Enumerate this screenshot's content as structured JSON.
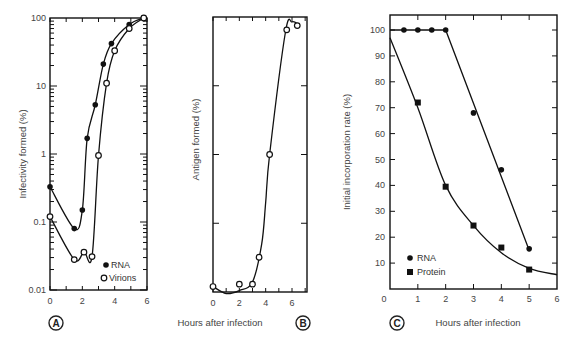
{
  "figure": {
    "shared_xlabel": "Hours after infection"
  },
  "chart_data": [
    {
      "panel": "A",
      "type": "line",
      "title": "",
      "xlabel": "Hours after infection",
      "ylabel": "Infectivity formed (%)",
      "yscale": "log",
      "xlim": [
        0,
        6
      ],
      "ylim": [
        0.01,
        100
      ],
      "xticks": [
        0,
        2,
        4,
        6
      ],
      "yticks": [
        0.01,
        0.1,
        1,
        10,
        100
      ],
      "ytick_labels": [
        "0.01",
        "0.1",
        "1",
        "10",
        "100"
      ],
      "legend": {
        "position": "lower right",
        "entries": [
          "RNA",
          "Virions"
        ]
      },
      "series": [
        {
          "name": "RNA",
          "marker": "filled-circle",
          "x": [
            0,
            1.5,
            2.0,
            2.3,
            2.8,
            3.3,
            3.8,
            4.9,
            5.8
          ],
          "values": [
            0.33,
            0.08,
            0.15,
            1.7,
            5.3,
            21,
            42,
            80,
            100
          ]
        },
        {
          "name": "Virions",
          "marker": "open-circle",
          "x": [
            0,
            1.5,
            2.1,
            2.6,
            3.0,
            3.5,
            4.0,
            4.9,
            5.8
          ],
          "values": [
            0.12,
            0.028,
            0.036,
            0.031,
            0.95,
            11,
            33,
            70,
            100
          ]
        }
      ],
      "panel_label": "A"
    },
    {
      "panel": "B",
      "type": "line",
      "title": "",
      "xlabel": "Hours after infection",
      "ylabel": "Antigen formed (%)",
      "yscale": "log",
      "xlim": [
        0,
        7
      ],
      "ylim": [
        0.01,
        100
      ],
      "xticks": [
        0,
        2,
        4,
        6
      ],
      "yticks": [],
      "legend": null,
      "series": [
        {
          "name": "Antigen",
          "marker": "open-circle",
          "x": [
            0,
            2.0,
            3.0,
            3.5,
            4.3,
            5.6,
            6.4
          ],
          "values": [
            0.012,
            0.013,
            0.013,
            0.032,
            1.0,
            65,
            75
          ]
        }
      ],
      "panel_label": "B"
    },
    {
      "panel": "C",
      "type": "line",
      "title": "",
      "xlabel": "Hours after infection",
      "ylabel": "Initial incorporation rate (%)",
      "yscale": "linear",
      "xlim": [
        0,
        6
      ],
      "ylim": [
        0,
        105
      ],
      "xticks": [
        0,
        1,
        2,
        3,
        4,
        5,
        6
      ],
      "yticks": [
        10,
        20,
        30,
        40,
        50,
        60,
        70,
        80,
        90,
        100
      ],
      "legend": {
        "position": "lower left",
        "entries": [
          "RNA",
          "Protein"
        ]
      },
      "series": [
        {
          "name": "RNA",
          "marker": "filled-circle",
          "x": [
            0.5,
            1,
            1.5,
            2,
            3,
            4,
            5
          ],
          "values": [
            100,
            100,
            100,
            100,
            68,
            46,
            15.5
          ]
        },
        {
          "name": "Protein",
          "marker": "filled-square",
          "x": [
            1,
            2,
            3,
            4,
            5
          ],
          "values": [
            72,
            39.5,
            24.5,
            16,
            7.5
          ]
        }
      ],
      "panel_label": "C"
    }
  ]
}
